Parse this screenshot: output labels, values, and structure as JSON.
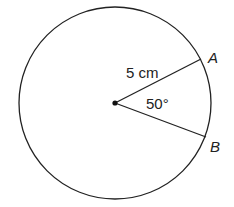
{
  "diagram": {
    "type": "circle-sector",
    "center": {
      "x": 115,
      "y": 103
    },
    "radius": 96,
    "points": [
      {
        "name": "A",
        "x": 201,
        "y": 59
      },
      {
        "name": "B",
        "x": 206,
        "y": 137
      }
    ],
    "labels": {
      "radius_label": "5 cm",
      "angle_label": "50°",
      "point_a": "A",
      "point_b": "B"
    },
    "colors": {
      "stroke": "#222222",
      "background": "#ffffff"
    }
  }
}
